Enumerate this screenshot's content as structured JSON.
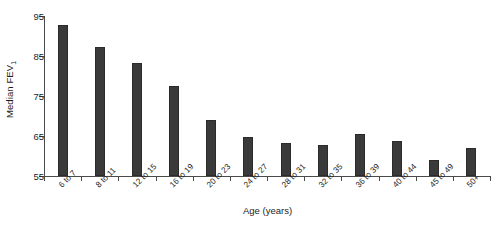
{
  "chart_data": {
    "type": "bar",
    "title": "",
    "xlabel": "Age (years)",
    "ylabel": "Median FEV₁",
    "ylabel_main": "Median FEV",
    "ylabel_sub": "1",
    "categories": [
      "6 to 7",
      "8 to 11",
      "12 to 15",
      "16 to 19",
      "20 to 23",
      "24 to 27",
      "28 to 31",
      "32 to 35",
      "36 to 39",
      "40 to 44",
      "45 to 49",
      "50+"
    ],
    "values": [
      92.8,
      87.3,
      83.2,
      77.5,
      69.0,
      64.8,
      63.3,
      62.7,
      65.6,
      63.8,
      58.9,
      61.9
    ],
    "ylim": [
      55,
      95
    ],
    "yticks": [
      55,
      65,
      75,
      85,
      95
    ],
    "ytick_labels": [
      "55",
      "65",
      "75",
      "85",
      "95"
    ],
    "grid": false,
    "legend": false,
    "bar_color": "#3a3a3a",
    "axis_color": "#4b4b4b",
    "background": "#ffffff"
  }
}
